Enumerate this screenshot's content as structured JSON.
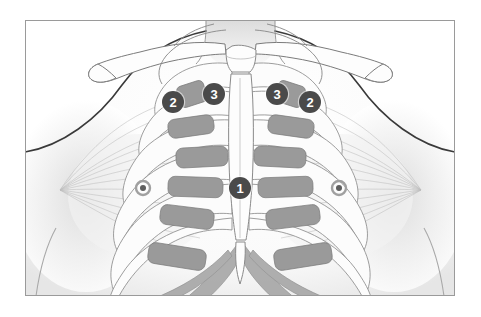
{
  "figure": {
    "frame": {
      "border_color": "#9a9a9a",
      "background_color": "#ffffff",
      "x": 25,
      "y": 20,
      "width": 430,
      "height": 276
    },
    "palette": {
      "background": "#ffffff",
      "skin_fill": "#fdfdfd",
      "skin_shadow": "#d8d8d8",
      "body_outline": "#3a3a3a",
      "bone_fill": "#fbfbfb",
      "bone_outline": "#7b7b7b",
      "cartilage_block": "#9a9a9a",
      "cartilage_block_outline": "#7a7a7a",
      "muscle_hatch": "#b9b9b9",
      "lower_rib_shade": "#a8a8a8",
      "marker_fill": "#4a4a4a",
      "marker_text": "#ffffff",
      "nipple_outer": "#a0a0a0",
      "nipple_inner": "#5e5e5e"
    }
  },
  "markers": [
    {
      "id": "marker-1",
      "label": "1",
      "x": 240,
      "y": 188,
      "r": 11,
      "side": "midline",
      "region": "lower-sternum"
    },
    {
      "id": "marker-2-left",
      "label": "2",
      "x": 173,
      "y": 102,
      "r": 11,
      "side": "patient-right",
      "region": "upper-chest-lateral"
    },
    {
      "id": "marker-3-left",
      "label": "3",
      "x": 214,
      "y": 94,
      "r": 11,
      "side": "patient-right",
      "region": "upper-chest-medial"
    },
    {
      "id": "marker-3-right",
      "label": "3",
      "x": 277,
      "y": 94,
      "r": 11,
      "side": "patient-left",
      "region": "upper-chest-medial"
    },
    {
      "id": "marker-2-right",
      "label": "2",
      "x": 310,
      "y": 102,
      "r": 11,
      "side": "patient-left",
      "region": "upper-chest-lateral"
    }
  ],
  "nipples": [
    {
      "id": "nipple-left",
      "x": 143,
      "y": 188,
      "r_outer": 7,
      "r_inner": 3
    },
    {
      "id": "nipple-right",
      "x": 339,
      "y": 188,
      "r_outer": 7,
      "r_inner": 3
    }
  ],
  "cartilage_blocks": [
    {
      "side": "left",
      "row": 1,
      "x": 178,
      "y": 83,
      "w": 28,
      "h": 22,
      "rx": 5,
      "rot": -18
    },
    {
      "side": "left",
      "row": 2,
      "x": 168,
      "y": 117,
      "w": 46,
      "h": 19,
      "rx": 7,
      "rot": -8
    },
    {
      "side": "left",
      "row": 3,
      "x": 176,
      "y": 147,
      "w": 52,
      "h": 20,
      "rx": 7,
      "rot": -3
    },
    {
      "side": "left",
      "row": 4,
      "x": 168,
      "y": 177,
      "w": 55,
      "h": 20,
      "rx": 7,
      "rot": 2
    },
    {
      "side": "left",
      "row": 5,
      "x": 160,
      "y": 207,
      "w": 54,
      "h": 20,
      "rx": 7,
      "rot": 7
    },
    {
      "side": "left",
      "row": 6,
      "x": 148,
      "y": 246,
      "w": 58,
      "h": 21,
      "rx": 7,
      "rot": 9
    },
    {
      "side": "right",
      "row": 1,
      "x": 276,
      "y": 83,
      "w": 28,
      "h": 22,
      "rx": 5,
      "rot": 18
    },
    {
      "side": "right",
      "row": 2,
      "x": 268,
      "y": 117,
      "w": 46,
      "h": 19,
      "rx": 7,
      "rot": 8
    },
    {
      "side": "right",
      "row": 3,
      "x": 254,
      "y": 147,
      "w": 52,
      "h": 20,
      "rx": 7,
      "rot": 3
    },
    {
      "side": "right",
      "row": 4,
      "x": 258,
      "y": 177,
      "w": 55,
      "h": 20,
      "rx": 7,
      "rot": -2
    },
    {
      "side": "right",
      "row": 5,
      "x": 266,
      "y": 207,
      "w": 54,
      "h": 20,
      "rx": 7,
      "rot": -7
    },
    {
      "side": "right",
      "row": 6,
      "x": 274,
      "y": 246,
      "w": 58,
      "h": 21,
      "rx": 7,
      "rot": -9
    }
  ],
  "anatomy_parts": [
    {
      "name": "body-silhouette",
      "description": "head, neck, shoulders and upper torso outline"
    },
    {
      "name": "clavicle-left",
      "description": "left collarbone"
    },
    {
      "name": "clavicle-right",
      "description": "right collarbone"
    },
    {
      "name": "sternum",
      "description": "manubrium, body and xiphoid process"
    },
    {
      "name": "ribcage-left",
      "description": "left ribs 1 through 10"
    },
    {
      "name": "ribcage-right",
      "description": "right ribs 1 through 10"
    },
    {
      "name": "pectoralis-left",
      "description": "left pectoralis major fan hatching to axilla"
    },
    {
      "name": "pectoralis-right",
      "description": "right pectoralis major fan hatching to axilla"
    },
    {
      "name": "costal-margin",
      "description": "lower rib arch / costal margin"
    }
  ]
}
